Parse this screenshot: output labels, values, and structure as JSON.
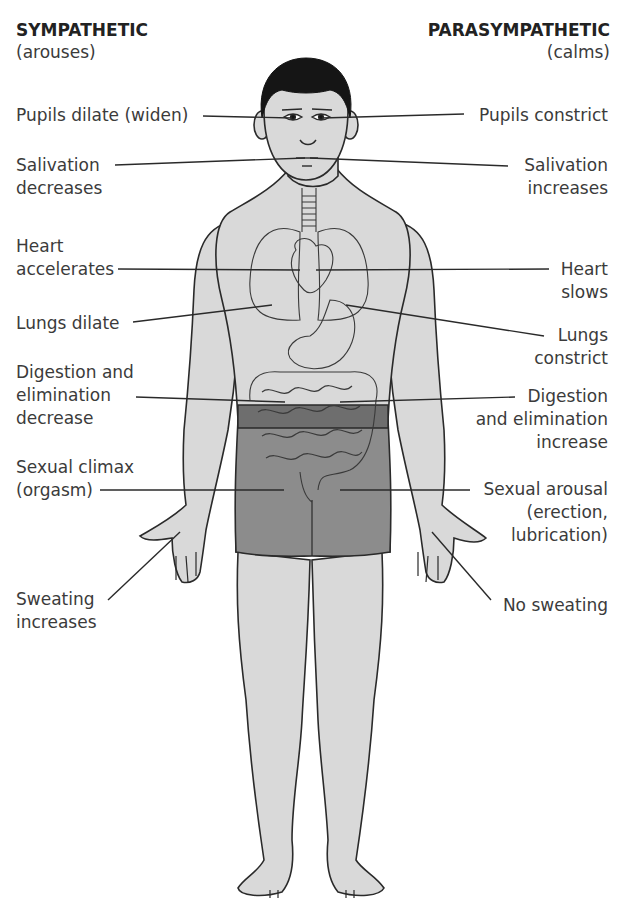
{
  "headers": {
    "left": {
      "title": "SYMPATHETIC",
      "subtitle": "(arouses)"
    },
    "right": {
      "title": "PARASYMPATHETIC",
      "subtitle": "(calms)"
    }
  },
  "sympathetic_labels": [
    {
      "lines": [
        "Pupils dilate (widen)"
      ]
    },
    {
      "lines": [
        "Salivation",
        "decreases"
      ]
    },
    {
      "lines": [
        "Heart",
        "accelerates"
      ]
    },
    {
      "lines": [
        "Lungs dilate"
      ]
    },
    {
      "lines": [
        "Digestion and",
        "elimination",
        "decrease"
      ]
    },
    {
      "lines": [
        "Sexual climax",
        "(orgasm)"
      ]
    },
    {
      "lines": [
        "Sweating",
        "increases"
      ]
    }
  ],
  "parasympathetic_labels": [
    {
      "lines": [
        "Pupils constrict"
      ]
    },
    {
      "lines": [
        "Salivation",
        "increases"
      ]
    },
    {
      "lines": [
        "Heart",
        "slows"
      ]
    },
    {
      "lines": [
        "Lungs",
        "constrict"
      ]
    },
    {
      "lines": [
        "Digestion",
        "and elimination",
        "increase"
      ]
    },
    {
      "lines": [
        "Sexual arousal",
        "(erection,",
        "lubrication)"
      ]
    },
    {
      "lines": [
        "No sweating"
      ]
    }
  ],
  "colors": {
    "skin": "#d9d9d9",
    "skin_shade": "#c9c9c9",
    "hair": "#151515",
    "shorts": "#8c8c8c",
    "belt": "#6e6e6e",
    "outline": "#2a2a2a",
    "leader": "#2a2a2a"
  }
}
